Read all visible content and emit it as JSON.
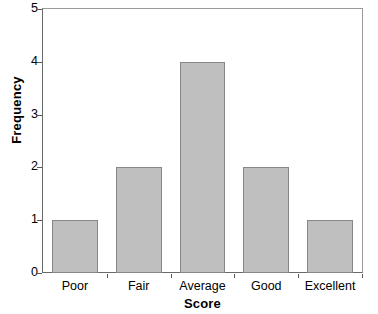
{
  "chart_data": {
    "type": "bar",
    "title": "",
    "subtitle": "",
    "xlabel": "Score",
    "ylabel": "Frequency",
    "categories": [
      "Poor",
      "Fair",
      "Average",
      "Good",
      "Excellent"
    ],
    "values": [
      1,
      2,
      4,
      2,
      1
    ],
    "ylim": [
      0,
      5
    ],
    "ytick_labels": [
      "0",
      "1",
      "2",
      "3",
      "4",
      "5"
    ],
    "ytick_values": [
      0,
      1,
      2,
      3,
      4,
      5
    ],
    "grid": false,
    "legend": null,
    "legend_position": "none",
    "annotations": [],
    "style": {
      "bar_fill": "#bfbfbf",
      "bar_border": "#878787",
      "axis_color": "#6a6a6a",
      "frame_color": "#9a9a9a",
      "text_color": "#000000",
      "background": "#ffffff"
    }
  }
}
